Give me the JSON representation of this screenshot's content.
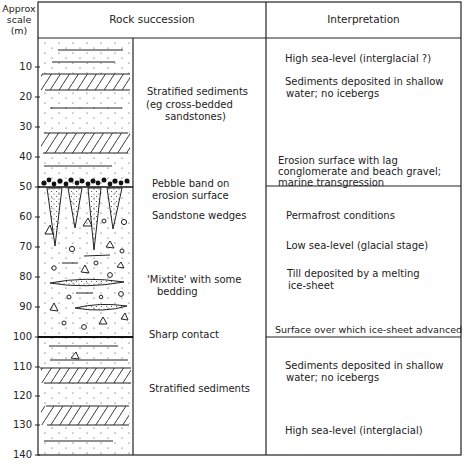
{
  "header": {
    "scale_title": "Approx scale (m)",
    "rock_succession": "Rock succession",
    "interpretation": "Interpretation"
  },
  "scale_ticks": [
    "10",
    "20",
    "30",
    "40",
    "50",
    "60",
    "70",
    "80",
    "90",
    "100",
    "110",
    "120",
    "130",
    "140"
  ],
  "rock_labels": {
    "stratified_top_1": "Stratified sediments",
    "stratified_top_2": "(eg cross-bedded",
    "stratified_top_3": "sandstones)",
    "pebble_1": "Pebble band on",
    "pebble_2": "erosion surface",
    "wedges": "Sandstone wedges",
    "mixtite_1": "'Mixtite' with some",
    "mixtite_2": "bedding",
    "sharp": "Sharp contact",
    "stratified_bottom": "Stratified sediments"
  },
  "interpretation": {
    "high_sea_top": "High sea-level (interglacial ?)",
    "shallow_top_1": "Sediments deposited in shallow",
    "shallow_top_2": "water; no icebergs",
    "erosion_1": "Erosion surface with lag",
    "erosion_2": "conglomerate and beach gravel;",
    "erosion_3": "marine transgression",
    "permafrost": "Permafrost conditions",
    "low_sea": "Low sea-level (glacial stage)",
    "till_1": "Till deposited by a melting",
    "till_2": "ice-sheet",
    "surface": "Surface over which ice-sheet advanced",
    "shallow_bottom_1": "Sediments deposited in shallow",
    "shallow_bottom_2": "water; no icebergs",
    "high_sea_bottom": "High sea-level (interglacial)"
  }
}
